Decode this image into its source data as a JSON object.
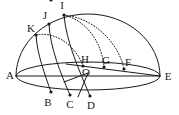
{
  "figure": {
    "background_color": "#ffffff",
    "ink_color": "#1a1a1a",
    "width": 179,
    "height": 115
  },
  "points": [
    {
      "id": "A",
      "label": "A",
      "x": 16,
      "y": 76,
      "label_x": 10,
      "label_y": 76,
      "dot": false
    },
    {
      "id": "E",
      "label": "E",
      "x": 160,
      "y": 76,
      "label_x": 168,
      "label_y": 77,
      "dot": false
    },
    {
      "id": "O",
      "label": "O",
      "x": 88,
      "y": 73,
      "label_x": 86,
      "label_y": 73,
      "dot": false
    },
    {
      "id": "B",
      "label": "B",
      "x": 51,
      "y": 92,
      "label_x": 48,
      "label_y": 103,
      "dot": true
    },
    {
      "id": "C",
      "label": "C",
      "x": 70,
      "y": 95,
      "label_x": 70,
      "label_y": 105,
      "dot": true
    },
    {
      "id": "D",
      "label": "D",
      "x": 90,
      "y": 96,
      "label_x": 91,
      "label_y": 106,
      "dot": true
    },
    {
      "id": "F",
      "label": "F",
      "x": 124,
      "y": 69,
      "label_x": 128,
      "label_y": 63,
      "dot": true
    },
    {
      "id": "G",
      "label": "G",
      "x": 104,
      "y": 67,
      "label_x": 106,
      "label_y": 61,
      "dot": true
    },
    {
      "id": "H",
      "label": "H",
      "x": 83,
      "y": 66,
      "label_x": 85,
      "label_y": 60,
      "dot": true
    },
    {
      "id": "I",
      "label": "I",
      "x": 64,
      "y": 15,
      "label_x": 62,
      "label_y": 6,
      "dot": true
    },
    {
      "id": "J",
      "label": "J",
      "x": 49,
      "y": 24,
      "label_x": 45,
      "label_y": 16,
      "dot": true
    },
    {
      "id": "K",
      "label": "K",
      "x": 36,
      "y": 35,
      "label_x": 31,
      "label_y": 29,
      "dot": true
    }
  ],
  "paths": {
    "dome_arc": {
      "name": "hemisphere-outline",
      "style": "solid",
      "d": "M 16 76 A 72 62 0 0 1 160 76"
    },
    "base_ellipse": {
      "name": "base-ellipse",
      "style": "solid",
      "d": "M 16 76 A 72 14 0 0 0 160 76 A 72 14 0 0 0 16 76 Z"
    },
    "diameter_AE": {
      "name": "diameter-a-e",
      "style": "solid",
      "d": "M 16 76 L 160 76"
    },
    "chord_HF_E": {
      "name": "chord-h-f-e",
      "style": "solid",
      "d": "M 66 64 L 160 76"
    },
    "meridian_I_D": {
      "name": "meridian-arc-i-d",
      "style": "solid",
      "d": "M 64 15 C 66 42 80 72 90 96"
    },
    "meridian_J_C": {
      "name": "meridian-arc-j-c",
      "style": "solid",
      "d": "M 49 24 C 50 48 61 74 70 95"
    },
    "meridian_K_B": {
      "name": "meridian-arc-k-b",
      "style": "solid",
      "d": "M 36 35 C 37 54 45 75 51 92"
    },
    "dotted_I_F": {
      "name": "dotted-arc-i-f",
      "style": "dotted",
      "d": "M 64 15 C 95 18 119 44 124 69"
    },
    "dotted_I_G": {
      "name": "dotted-arc-i-g",
      "style": "dotted",
      "d": "M 64 15 C 88 21 102 44 104 67"
    },
    "dotted_K_H": {
      "name": "dotted-arc-k-h",
      "style": "dotted",
      "d": "M 36 35 C 56 31 76 46 83 66"
    },
    "radius_O_D": {
      "name": "radius-o-d",
      "style": "solid",
      "d": "M 88 73 L 78 97"
    },
    "radius_O_B": {
      "name": "radius-o-c",
      "style": "solid",
      "d": "M 88 73 L 64 82"
    }
  },
  "labels_order": [
    "A",
    "E",
    "O",
    "B",
    "C",
    "D",
    "F",
    "G",
    "H",
    "I",
    "J",
    "K"
  ]
}
